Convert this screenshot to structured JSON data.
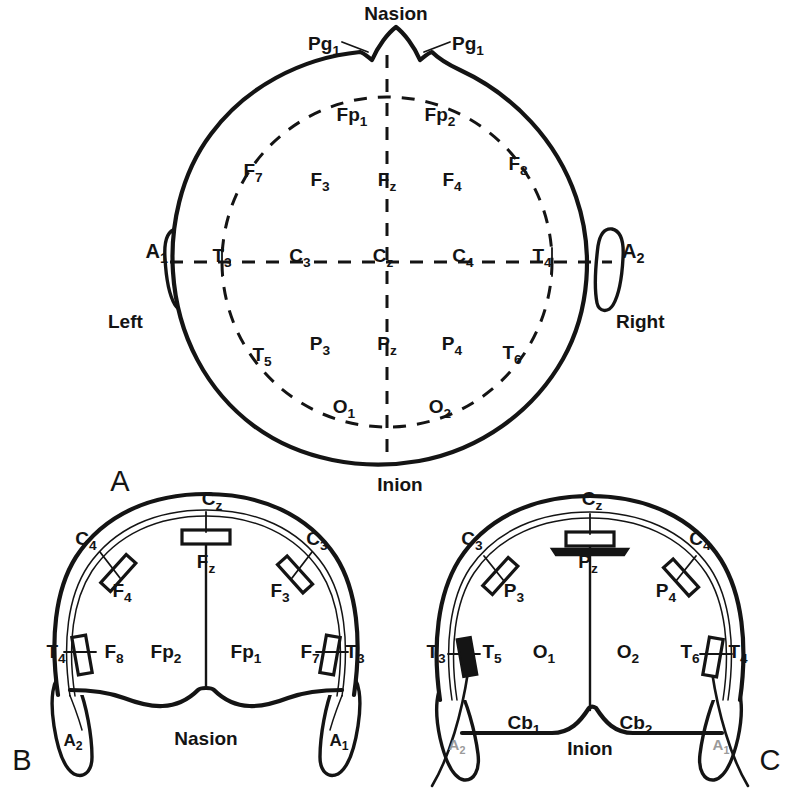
{
  "figure": {
    "panels": [
      {
        "id": "A",
        "label": "A",
        "view": "superior (top-down) head view"
      },
      {
        "id": "B",
        "label": "B",
        "view": "anterior (frontal) head view"
      },
      {
        "id": "C",
        "label": "C",
        "view": "posterior (occipital) head view"
      }
    ]
  },
  "panel_a": {
    "landmarks": {
      "nasion": "Nasion",
      "inion": "Inion",
      "left": "Left",
      "right": "Right"
    },
    "pg_left": {
      "base": "Pg",
      "sub": "1"
    },
    "pg_right": {
      "base": "Pg",
      "sub": "1"
    },
    "ear_left": {
      "base": "A",
      "sub": "1"
    },
    "ear_right": {
      "base": "A",
      "sub": "2"
    },
    "electrodes": [
      {
        "base": "Fp",
        "sub": "1",
        "x": 352,
        "y": 121
      },
      {
        "base": "Fp",
        "sub": "2",
        "x": 440,
        "y": 121
      },
      {
        "base": "F",
        "sub": "7",
        "x": 253,
        "y": 177
      },
      {
        "base": "F",
        "sub": "3",
        "x": 320,
        "y": 186
      },
      {
        "base": "F",
        "sub": "z",
        "x": 387,
        "y": 186
      },
      {
        "base": "F",
        "sub": "4",
        "x": 452,
        "y": 186
      },
      {
        "base": "F",
        "sub": "8",
        "x": 518,
        "y": 170
      },
      {
        "base": "T",
        "sub": "3",
        "x": 222,
        "y": 262
      },
      {
        "base": "C",
        "sub": "3",
        "x": 300,
        "y": 262
      },
      {
        "base": "C",
        "sub": "z",
        "x": 383,
        "y": 262
      },
      {
        "base": "C",
        "sub": "4",
        "x": 463,
        "y": 262
      },
      {
        "base": "T",
        "sub": "4",
        "x": 542,
        "y": 262
      },
      {
        "base": "T",
        "sub": "5",
        "x": 262,
        "y": 361
      },
      {
        "base": "P",
        "sub": "3",
        "x": 320,
        "y": 350
      },
      {
        "base": "P",
        "sub": "z",
        "x": 387,
        "y": 350
      },
      {
        "base": "P",
        "sub": "4",
        "x": 452,
        "y": 350
      },
      {
        "base": "T",
        "sub": "6",
        "x": 512,
        "y": 359
      },
      {
        "base": "O",
        "sub": "1",
        "x": 344,
        "y": 413
      },
      {
        "base": "O",
        "sub": "2",
        "x": 440,
        "y": 413
      }
    ]
  },
  "panel_b": {
    "landmark": "Nasion",
    "panel_label": "B",
    "electrodes": [
      {
        "base": "C",
        "sub": "z",
        "x": 212,
        "y": 505
      },
      {
        "base": "C",
        "sub": "4",
        "x": 86,
        "y": 545
      },
      {
        "base": "C",
        "sub": "3",
        "x": 317,
        "y": 545
      },
      {
        "base": "F",
        "sub": "z",
        "x": 206,
        "y": 568
      },
      {
        "base": "F",
        "sub": "4",
        "x": 122,
        "y": 597
      },
      {
        "base": "F",
        "sub": "3",
        "x": 280,
        "y": 597
      },
      {
        "base": "T",
        "sub": "4",
        "x": 56,
        "y": 658
      },
      {
        "base": "F",
        "sub": "8",
        "x": 114,
        "y": 658
      },
      {
        "base": "Fp",
        "sub": "2",
        "x": 166,
        "y": 658
      },
      {
        "base": "Fp",
        "sub": "1",
        "x": 246,
        "y": 658
      },
      {
        "base": "F",
        "sub": "7",
        "x": 310,
        "y": 658
      },
      {
        "base": "T",
        "sub": "3",
        "x": 355,
        "y": 658
      }
    ],
    "ear_left": {
      "base": "A",
      "sub": "2"
    },
    "ear_right": {
      "base": "A",
      "sub": "1"
    }
  },
  "panel_c": {
    "landmark": "Inion",
    "panel_label": "C",
    "electrodes": [
      {
        "base": "C",
        "sub": "z",
        "x": 592,
        "y": 505
      },
      {
        "base": "C",
        "sub": "3",
        "x": 472,
        "y": 545
      },
      {
        "base": "C",
        "sub": "4",
        "x": 700,
        "y": 545
      },
      {
        "base": "P",
        "sub": "z",
        "x": 588,
        "y": 568
      },
      {
        "base": "P",
        "sub": "3",
        "x": 514,
        "y": 597
      },
      {
        "base": "P",
        "sub": "4",
        "x": 666,
        "y": 597
      },
      {
        "base": "T",
        "sub": "3",
        "x": 436,
        "y": 658
      },
      {
        "base": "T",
        "sub": "5",
        "x": 492,
        "y": 658
      },
      {
        "base": "O",
        "sub": "1",
        "x": 544,
        "y": 658
      },
      {
        "base": "O",
        "sub": "2",
        "x": 628,
        "y": 658
      },
      {
        "base": "T",
        "sub": "6",
        "x": 690,
        "y": 658
      },
      {
        "base": "T",
        "sub": "4",
        "x": 738,
        "y": 658
      }
    ],
    "cerebellar": [
      {
        "base": "Cb",
        "sub": "1",
        "x": 524,
        "y": 729
      },
      {
        "base": "Cb",
        "sub": "2",
        "x": 636,
        "y": 729
      }
    ],
    "ear_left": {
      "base": "A",
      "sub": "2"
    },
    "ear_right": {
      "base": "A",
      "sub": "1"
    }
  },
  "colors": {
    "ink": "#141414",
    "paper": "#ffffff",
    "faded_ink": "#9a9a9a"
  }
}
